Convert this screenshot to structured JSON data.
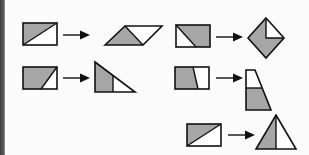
{
  "diagram": {
    "colors": {
      "shaded": "#a6a6a6",
      "unshaded": "#ffffff",
      "stroke": "#111111",
      "background": "#fbfbfb"
    },
    "transformations": [
      {
        "id": 1,
        "from": "rectangle-cut-diagonal",
        "to": "parallelogram",
        "position": "row1-left"
      },
      {
        "id": 2,
        "from": "rectangle-cut-corner",
        "to": "square-rotated-diamond",
        "position": "row1-right"
      },
      {
        "id": 3,
        "from": "rectangle-cut-slanted",
        "to": "right-triangle",
        "position": "row2-left"
      },
      {
        "id": 4,
        "from": "rectangle-cut-near-vertical",
        "to": "trapezoid",
        "position": "row2-right"
      },
      {
        "id": 5,
        "from": "rectangle-cut-diagonal",
        "to": "isosceles-triangle",
        "position": "row3-right"
      }
    ]
  }
}
